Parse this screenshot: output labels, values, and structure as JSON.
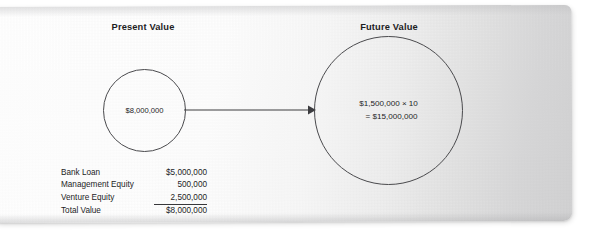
{
  "figure": {
    "headers": {
      "present": "Present Value",
      "future": "Future Value"
    },
    "present_circle": {
      "value": "$8,000,000"
    },
    "future_circle": {
      "line1": "$1,500,000 × 10",
      "line2": "= $15,000,000"
    },
    "arrow": {
      "name": "flow-arrow",
      "direction": "left-to-right"
    },
    "table": {
      "rows": [
        {
          "label": "Bank Loan",
          "value": "$5,000,000",
          "indent": false,
          "ruled": false
        },
        {
          "label": "Management Equity",
          "value": "500,000",
          "indent": false,
          "ruled": false
        },
        {
          "label": "Venture Equity",
          "value": "2,500,000",
          "indent": false,
          "ruled": false
        },
        {
          "label": "Total Value",
          "value": "$8,000,000",
          "indent": true,
          "ruled": true
        }
      ]
    },
    "colors": {
      "ink": "#1d1d1f",
      "stroke": "#4a4a4d",
      "paper": "#ffffff",
      "shade": "#d2d2d3"
    }
  }
}
